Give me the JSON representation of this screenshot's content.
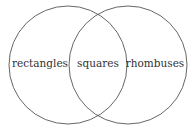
{
  "diagram": {
    "type": "venn",
    "stroke_color": "#555555",
    "text_color": "#333333",
    "sets": [
      {
        "id": "left",
        "label": "rectangles",
        "cx": 68,
        "cy": 65,
        "r": 59
      },
      {
        "id": "right",
        "label": "rhombuses",
        "cx": 128,
        "cy": 65,
        "r": 59
      }
    ],
    "intersection": {
      "label": "squares"
    }
  }
}
